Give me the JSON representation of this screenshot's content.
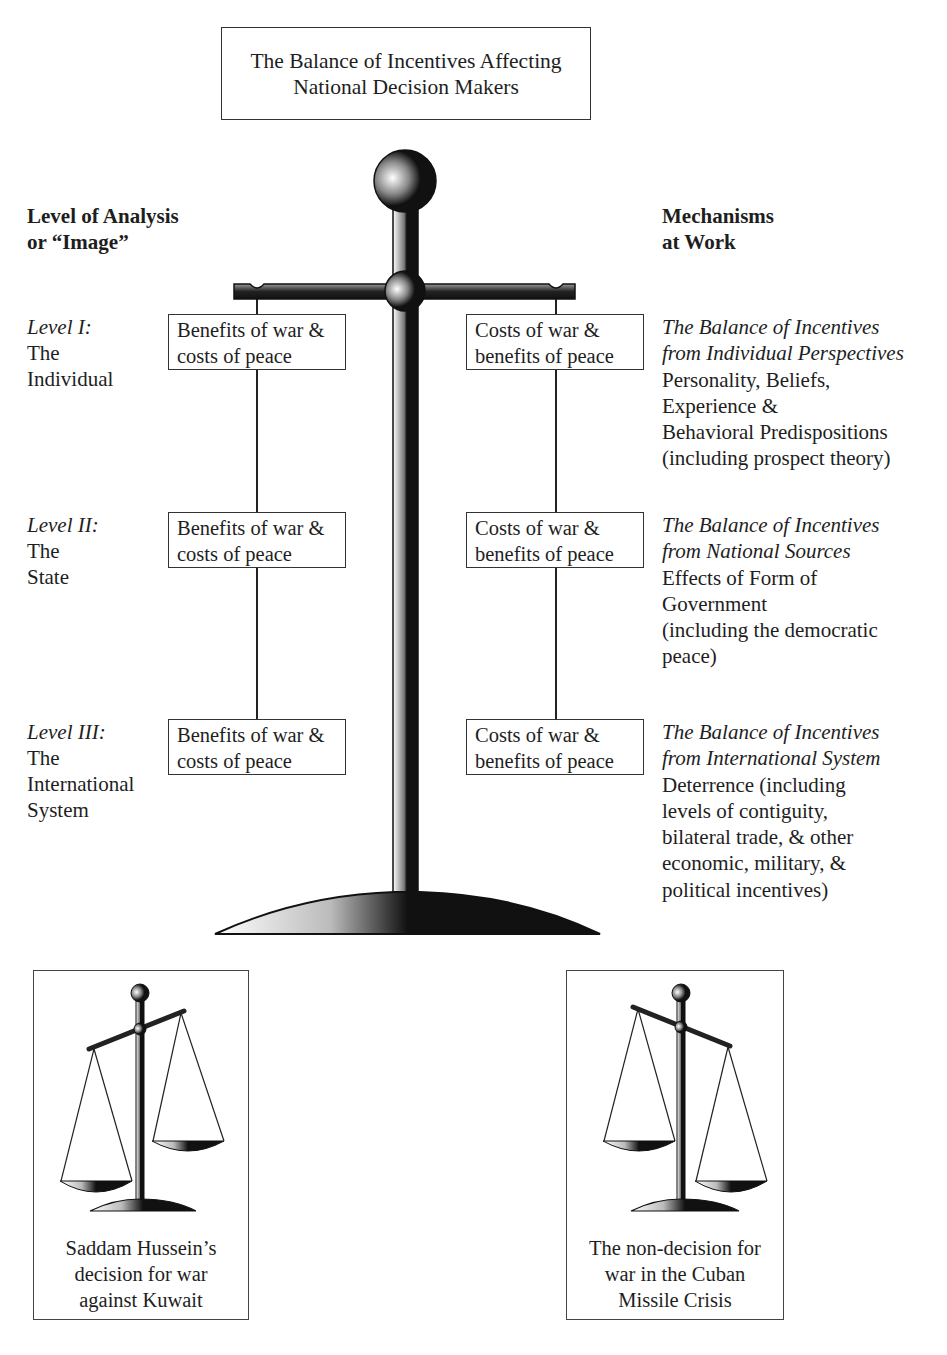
{
  "title": {
    "line1": "The Balance of Incentives Affecting",
    "line2": "National Decision Makers"
  },
  "left_heading": {
    "line1": "Level of Analysis",
    "line2": "or “Image”"
  },
  "right_heading": {
    "line1": "Mechanisms",
    "line2": "at Work"
  },
  "levels": [
    {
      "level": "Level I:",
      "name_lines": [
        "The",
        "Individual"
      ],
      "left_box": [
        "Benefits of war &",
        "costs of peace"
      ],
      "right_box": [
        "Costs of war &",
        "benefits of peace"
      ],
      "mechanism_title": [
        "The Balance of Incentives",
        "from Individual Perspectives"
      ],
      "mechanism_body": [
        "Personality, Beliefs,",
        "Experience &",
        "Behavioral Predispositions",
        "(including prospect theory)"
      ]
    },
    {
      "level": "Level II:",
      "name_lines": [
        "The",
        "State"
      ],
      "left_box": [
        "Benefits of war &",
        "costs of peace"
      ],
      "right_box": [
        "Costs of war &",
        "benefits of peace"
      ],
      "mechanism_title": [
        "The Balance of Incentives",
        "from National Sources"
      ],
      "mechanism_body": [
        "Effects of Form of",
        "Government",
        "(including the democratic",
        "peace)"
      ]
    },
    {
      "level": "Level III:",
      "name_lines": [
        "The",
        "International",
        "System"
      ],
      "left_box": [
        "Benefits of war &",
        "costs of peace"
      ],
      "right_box": [
        "Costs of war &",
        "benefits of peace"
      ],
      "mechanism_title": [
        "The Balance of Incentives",
        "from International System"
      ],
      "mechanism_body": [
        "Deterrence (including",
        "levels of contiguity,",
        "bilateral trade, & other",
        "economic, military, &",
        "political incentives)"
      ]
    }
  ],
  "cases": [
    {
      "caption": [
        "Saddam Hussein’s",
        "decision for war",
        "against Kuwait"
      ],
      "tilt": "left-pan-down"
    },
    {
      "caption": [
        "The non-decision for",
        "war in the Cuban",
        "Missile Crisis"
      ],
      "tilt": "right-pan-down"
    }
  ]
}
